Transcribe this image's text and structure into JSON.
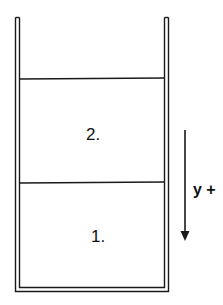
{
  "diagram": {
    "type": "two-layer fluid container",
    "colors": {
      "stroke": "#1a1a1a",
      "background": "#ffffff"
    },
    "layers": [
      {
        "label": "2.",
        "position": "upper"
      },
      {
        "label": "1.",
        "position": "lower"
      }
    ],
    "axis": {
      "label": "y +",
      "direction": "down"
    }
  }
}
